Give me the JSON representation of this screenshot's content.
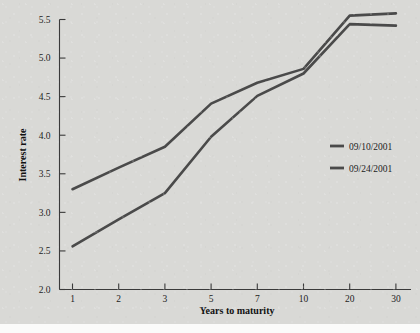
{
  "figure": {
    "background_color": "#d9d9d6",
    "ink_color": "#4a4a4a",
    "text_color": "#1d1d1d"
  },
  "chart_data": {
    "type": "line",
    "title": "",
    "xlabel": "Years to maturity",
    "ylabel": "Interest rate",
    "categories": [
      "1",
      "2",
      "3",
      "5",
      "7",
      "10",
      "20",
      "30"
    ],
    "x_tick_labels": [
      "1",
      "2",
      "3",
      "5",
      "7",
      "10",
      "20",
      "30"
    ],
    "y_tick_labels": [
      "2.0",
      "2.5",
      "3.0",
      "3.5",
      "4.0",
      "4.5",
      "5.0",
      "5.5"
    ],
    "y_tick_values": [
      2.0,
      2.5,
      3.0,
      3.5,
      4.0,
      4.5,
      5.0,
      5.5
    ],
    "ylim": [
      2.0,
      5.5
    ],
    "grid": false,
    "legend_position": "center right",
    "series": [
      {
        "name": "09/10/2001",
        "color": "#4a4a4a",
        "values": [
          3.3,
          3.58,
          3.85,
          4.41,
          4.68,
          4.86,
          5.55,
          5.58
        ]
      },
      {
        "name": "09/24/2001",
        "color": "#4a4a4a",
        "values": [
          2.56,
          2.91,
          3.25,
          3.98,
          4.51,
          4.8,
          5.44,
          5.42
        ]
      }
    ],
    "legend_entries": [
      "09/10/2001",
      "09/24/2001"
    ]
  }
}
